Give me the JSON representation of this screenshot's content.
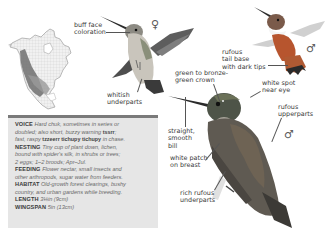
{
  "page": {
    "background": "#ffffff",
    "accent_rufous": "#b7552e",
    "box_background": "#e6e6e6",
    "box_topbar": "#7a7a7a"
  },
  "range_map": {
    "alt": "North America range map",
    "breeding_color": "#6e6e6e",
    "land_color": "#f1f1f1"
  },
  "figures": {
    "female": {
      "symbol": "♀",
      "callouts": [
        "buff face\ncoloration",
        "whitish\nunderparts"
      ]
    },
    "male_flying": {
      "symbol": "♂",
      "callouts": [
        "rufous\ntail base\nwith dark tips"
      ]
    },
    "male_perched": {
      "symbol": "♂",
      "callouts": [
        "green to bronze-\ngreen crown",
        "white spot\nnear eye",
        "rufous\nupperparts",
        "straight,\nsmooth\nbill",
        "white patch\non breast",
        "rich rufous\nunderparts"
      ]
    }
  },
  "info": {
    "voice": {
      "label": "VOICE",
      "line1": "Hard chuk, sometimes in series or",
      "line2a": "doubled; also short, buzzy warning ",
      "line2b": "tssrr",
      "line2c": ";",
      "line3a": "fast, raspy ",
      "line3b": "tzzeerr tichupy tichupy",
      "line3c": " in chase."
    },
    "nesting": {
      "label": "NESTING",
      "line1": "Tiny cup of plant down, lichen,",
      "line2": "bound with spider's silk, in shrubs or trees;",
      "line3": "2 eggs; 1–2 broods; Apr–Jul."
    },
    "feeding": {
      "label": "FEEDING",
      "line1": "Flower nectar, small insects and",
      "line2": "other arthropods, sugar water from feeders."
    },
    "habitat": {
      "label": "HABITAT",
      "line1": "Old-growth forest clearings, bushy",
      "line2": "country, and urban gardens while breeding."
    },
    "length": {
      "label": "LENGTH",
      "value": "3¼in (9cm)"
    },
    "wingspan": {
      "label": "WINGSPAN",
      "value": "5in (13cm)"
    }
  }
}
